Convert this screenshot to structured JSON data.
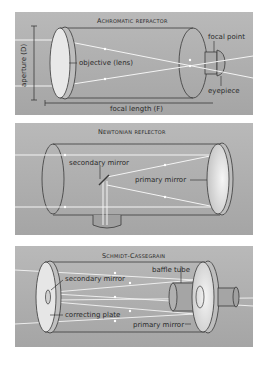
{
  "panels": [
    {
      "title": "Achromatic refractor",
      "labels": {
        "aperture": "aperture (D)",
        "objective": "objective (lens)",
        "focal_point": "focal point",
        "eyepiece": "eyepiece",
        "focal_length": "focal length (F)"
      }
    },
    {
      "title": "Newtonian reflector",
      "labels": {
        "secondary_mirror": "secondary mirror",
        "primary_mirror": "primary mirror"
      }
    },
    {
      "title": "Schmidt-Cassegrain",
      "labels": {
        "baffle_tube": "baffle tube",
        "secondary_mirror": "secondary mirror",
        "correcting_plate": "correcting plate",
        "primary_mirror": "primary mirror"
      }
    }
  ],
  "colors": {
    "panel_bg": "#b0b0b0",
    "outline": "#3a3a3a",
    "light_ray": "#f4f4f4",
    "lens_fill": "#e6e6e6"
  }
}
